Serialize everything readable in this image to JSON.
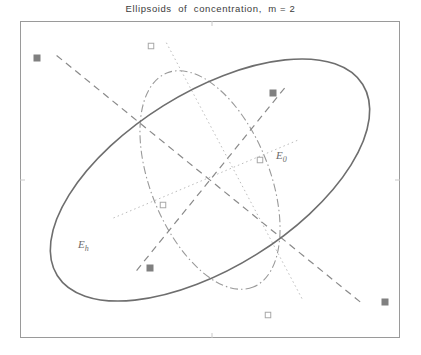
{
  "figure": {
    "title": "Ellipsoids  of  concentration,  m = 2",
    "width": 421,
    "height": 355,
    "background": "#ffffff",
    "axes": {
      "frame_color": "#9a9a9a",
      "frame_left": 20,
      "frame_top": 21,
      "frame_right": 400,
      "frame_bottom": 338,
      "ticks": {
        "top": [
          212
        ],
        "bottom": [
          212
        ],
        "left": [
          180
        ],
        "right": [
          180
        ],
        "color": "#c9c9c9",
        "labels_visible": false
      }
    },
    "labels": [
      {
        "name": "label-E-h",
        "text": "E",
        "sub": "h",
        "x": 78,
        "y": 248,
        "color": "#7a7a7a"
      },
      {
        "name": "label-E-0",
        "text": "E",
        "sub": "0",
        "x": 276,
        "y": 159,
        "color": "#7a7a7a"
      }
    ]
  },
  "chart_data": {
    "type": "scatter",
    "title": "Ellipsoids  of  concentration,  m = 2",
    "xlabel": "",
    "ylabel": "",
    "xlim": [
      -1.35,
      1.35
    ],
    "ylim": [
      -1.12,
      1.12
    ],
    "grid": false,
    "legend": null,
    "annotations": [
      {
        "text": "E_h",
        "x": -0.93,
        "y": -0.47
      },
      {
        "text": "E_0",
        "x": 0.48,
        "y": 0.16
      }
    ],
    "series": [
      {
        "name": "ellipse-E-h",
        "kind": "ellipse",
        "style": "solid",
        "color": "#6e6e6e",
        "linewidth": 1.6,
        "center": [
          0.0,
          0.0
        ],
        "semi_major": 1.28,
        "semi_minor": 0.62,
        "rotation_deg": -32.0
      },
      {
        "name": "ellipse-E-0",
        "kind": "ellipse",
        "style": "dashdot",
        "color": "#9a9a9a",
        "linewidth": 1.1,
        "center": [
          0.0,
          0.0
        ],
        "semi_major": 0.82,
        "semi_minor": 0.42,
        "rotation_deg": 68.0
      },
      {
        "name": "axes-E-h",
        "kind": "axis-lines",
        "style": "dashed",
        "color": "#8a8a8a",
        "linewidth": 1.2,
        "endpoints": [
          [
            -1.09,
            0.88
          ],
          [
            1.09,
            -0.88
          ],
          [
            0.53,
            0.65
          ],
          [
            -0.53,
            -0.65
          ]
        ],
        "markers": "filled-square",
        "marker_color": "#808080"
      },
      {
        "name": "axes-E-0",
        "kind": "axis-lines",
        "style": "dotted",
        "color": "#bcbcbc",
        "linewidth": 1.0,
        "endpoints": [
          [
            -0.31,
            0.97
          ],
          [
            0.66,
            -0.85
          ],
          [
            0.62,
            0.28
          ],
          [
            -0.69,
            -0.27
          ]
        ],
        "markers": "open-square",
        "marker_color": "#a8a8a8"
      }
    ],
    "points": [
      {
        "name": "vertex-Eh-major-upper-left",
        "px": 37,
        "py": 58,
        "marker": "filled-square"
      },
      {
        "name": "vertex-Eh-major-lower-right",
        "px": 385,
        "py": 302,
        "marker": "filled-square"
      },
      {
        "name": "vertex-Eh-minor-upper-right",
        "px": 273,
        "py": 93,
        "marker": "filled-square"
      },
      {
        "name": "vertex-Eh-minor-lower-left",
        "px": 150,
        "py": 268,
        "marker": "filled-square"
      },
      {
        "name": "vertex-E0-major-top",
        "px": 151,
        "py": 46,
        "marker": "open-square"
      },
      {
        "name": "vertex-E0-major-bottom",
        "px": 268,
        "py": 315,
        "marker": "open-square"
      },
      {
        "name": "vertex-E0-minor-right",
        "px": 260,
        "py": 160,
        "marker": "open-square"
      },
      {
        "name": "vertex-E0-minor-left",
        "px": 163,
        "py": 205,
        "marker": "open-square"
      }
    ],
    "center": {
      "px": 210,
      "py": 180
    }
  }
}
